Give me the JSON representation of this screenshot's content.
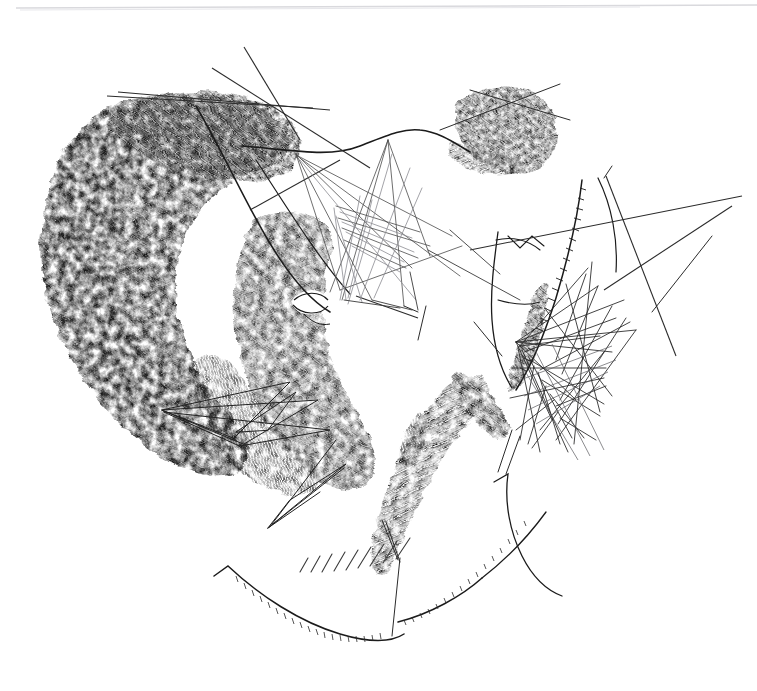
{
  "artwork": {
    "title": "Untitled ink drawing",
    "medium": "pen and ink on paper",
    "style": "gestural scratch hatching with straight-line tangles",
    "canvas": {
      "width": 757,
      "height": 691
    },
    "background_color": "#ffffff",
    "ink_color": "#111111",
    "faint_line_color": "#d9d9dd",
    "mid_gray": "#6b6b70"
  },
  "elements": {
    "top_rule": {
      "name": "faint-top-rule",
      "y": 6,
      "x1": 14,
      "x2": 756,
      "color": "#d9d9dd"
    },
    "masses": [
      {
        "name": "hair-mass-left",
        "description": "large crescent of dense scratchy hatching forming hair / head silhouette at upper left"
      },
      {
        "name": "face-mass-center",
        "description": "dark hatched mass forming cheek and jaw with a reserved white eye shape"
      },
      {
        "name": "blob-upper-right",
        "description": "small wedge-shaped dark hatched blob at upper right"
      },
      {
        "name": "limb-mass-lower-center",
        "description": "diagonal dark hatched band descending to lower centre, like an arm or drapery"
      },
      {
        "name": "shoulder-mass-right",
        "description": "dark hatched taper along the right contour curve"
      }
    ],
    "line_groups": [
      {
        "name": "long-diagonals-upper-left",
        "count": 4,
        "description": "long thin ruled diagonals crossing the upper left"
      },
      {
        "name": "line-tangle-upper-center",
        "count": 26,
        "description": "web of pale crossing straight lines between the two masses"
      },
      {
        "name": "line-tangle-right",
        "count": 34,
        "description": "dense triangular scribble of ruled straight lines right of centre"
      },
      {
        "name": "triangle-web-lower-left",
        "count": 8,
        "description": "elongated thin triangles overlapping the lower mass"
      },
      {
        "name": "long-diagonals-right",
        "count": 3,
        "description": "long ruled diagonals sweeping to the right edge"
      }
    ],
    "contours": [
      {
        "name": "brow-contour",
        "description": "long arcing contour sweeping right from the hair mass"
      },
      {
        "name": "neck-contour",
        "description": "soft vertical contour of neck and shoulder at centre right"
      },
      {
        "name": "serrated-spine-curve",
        "description": "curve with comb-like serrations running down the right of centre"
      },
      {
        "name": "jaw-curve-bottom",
        "description": "long shallow curve with fine whisker serrations at lower left"
      },
      {
        "name": "hook-curve-bottom-right",
        "description": "hooked curve at lower right resembling a hand or fin"
      }
    ],
    "hatch_patches": [
      {
        "name": "diagonal-hatch-bottom-center",
        "strokes": 9,
        "description": "short parallel diagonal tick strokes below the jaw curve"
      }
    ],
    "eye": {
      "name": "eye-reserve",
      "description": "almond shaped white reserve with lid lines inside the central dark mass"
    }
  }
}
